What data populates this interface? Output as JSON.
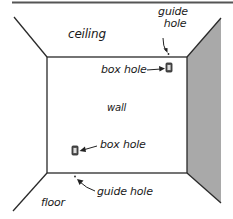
{
  "diagram": {
    "type": "room-interior-perspective",
    "colors": {
      "line": "#2a2a2a",
      "right_wall_shade": "#a9a9a9",
      "background": "#ffffff"
    },
    "regions": {
      "ceiling": "ceiling",
      "wall": "wall",
      "floor": "floor"
    },
    "callouts": [
      {
        "id": "guide-hole-top",
        "label_line1": "guide",
        "label_line2": "hole"
      },
      {
        "id": "box-hole-top",
        "label": "box hole"
      },
      {
        "id": "box-hole-bottom",
        "label": "box hole"
      },
      {
        "id": "guide-hole-bottom",
        "label": "guide hole"
      }
    ]
  }
}
